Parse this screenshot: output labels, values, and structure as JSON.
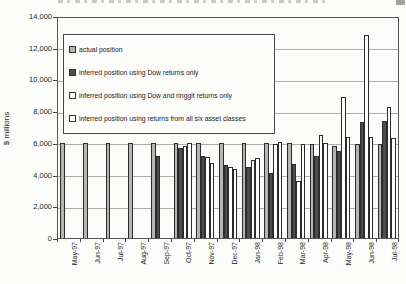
{
  "chart_data": {
    "type": "bar",
    "title": "",
    "xlabel": "",
    "ylabel": "$ millions",
    "ylim": [
      0,
      14000
    ],
    "ytick_step": 2000,
    "grid": "horizontal",
    "legend_position": "inside-top-left",
    "categories": [
      "May-97",
      "Jun-97",
      "Jul-97",
      "Aug-97",
      "Sep-97",
      "Oct-97",
      "Nov-97",
      "Dec-97",
      "Jan-98",
      "Feb-98",
      "Mar-98",
      "Apr-98",
      "May-98",
      "Jun-98",
      "Jul-98"
    ],
    "series": [
      {
        "name": "actual position",
        "swatch": "gray",
        "values": [
          6000,
          6000,
          6000,
          6000,
          6000,
          6000,
          6000,
          6000,
          6000,
          6000,
          6000,
          5900,
          5800,
          5900,
          5900
        ]
      },
      {
        "name": "inferred position using Dow returns only",
        "swatch": "dark",
        "values": [
          null,
          null,
          null,
          null,
          5200,
          5700,
          5200,
          4600,
          4500,
          4100,
          4650,
          5200,
          5500,
          7300,
          7400
        ]
      },
      {
        "name": "inferred position using Dow and ringgit returns only",
        "swatch": "white",
        "values": [
          null,
          null,
          null,
          null,
          null,
          5800,
          5100,
          4450,
          4900,
          5900,
          3600,
          6500,
          8900,
          12800,
          8250
        ]
      },
      {
        "name": "inferred position using returns from all six asset classes",
        "swatch": "white",
        "values": [
          null,
          null,
          null,
          null,
          null,
          6000,
          4700,
          4350,
          5050,
          6050,
          5950,
          6000,
          6400,
          6350,
          6300
        ]
      }
    ],
    "colors": {
      "gray_fill": "#b5b5b3",
      "dark_fill": "#4d4d4d",
      "white_fill": "#fdfdfc",
      "outline": "#2c2c2c",
      "gridline": "#adadaa"
    }
  }
}
